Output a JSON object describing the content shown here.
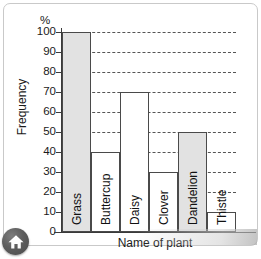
{
  "chart_data": {
    "type": "bar",
    "title": "",
    "xlabel": "Name of plant",
    "ylabel": "Frequency",
    "unit_label": "%",
    "categories": [
      "Grass",
      "Buttercup",
      "Daisy",
      "Clover",
      "Dandelion",
      "Thistle"
    ],
    "values": [
      100,
      40,
      70,
      30,
      50,
      10
    ],
    "bar_fills": [
      "#e2e2e2",
      "#ffffff",
      "#ffffff",
      "#ffffff",
      "#e2e2e2",
      "#ffffff"
    ],
    "ylim": [
      0,
      100
    ],
    "ytick_step": 10,
    "ytick_labels": [
      "100",
      "90",
      "80",
      "70",
      "60",
      "50",
      "40",
      "30",
      "20",
      "10",
      "0"
    ],
    "grid": true,
    "grid_style": "dashed-horizontal",
    "legend": "none",
    "bar_border_color": "#4a4a4a",
    "axis_color": "#3a3a3a"
  },
  "controls": {
    "home_button_label": "Home",
    "home_icon": "home-icon"
  }
}
